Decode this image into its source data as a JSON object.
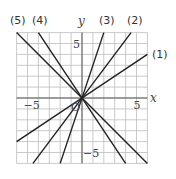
{
  "chart_data": {
    "type": "line",
    "title": "",
    "xlabel": "x",
    "ylabel": "y",
    "xlim": [
      -6,
      6
    ],
    "ylim": [
      -6,
      6
    ],
    "grid": true,
    "origin_label": "O",
    "ticks": {
      "x": [
        {
          "value": -5,
          "label": "−5"
        },
        {
          "value": 5,
          "label": "5"
        }
      ],
      "y": [
        {
          "value": 5,
          "label": "5"
        },
        {
          "value": -5,
          "label": "−5"
        }
      ]
    },
    "series": [
      {
        "name": "(1)",
        "slope": 0.6667,
        "points": [
          [
            -6,
            -4
          ],
          [
            6,
            4
          ]
        ]
      },
      {
        "name": "(2)",
        "slope": 1.3333,
        "points": [
          [
            -4.5,
            -6
          ],
          [
            4.5,
            6
          ]
        ]
      },
      {
        "name": "(3)",
        "slope": 3,
        "points": [
          [
            -2,
            -6
          ],
          [
            2,
            6
          ]
        ]
      },
      {
        "name": "(4)",
        "slope": -1.5,
        "points": [
          [
            -4,
            6
          ],
          [
            4,
            -6
          ]
        ]
      },
      {
        "name": "(5)",
        "slope": -1,
        "points": [
          [
            -6,
            6
          ],
          [
            6,
            -6
          ]
        ]
      }
    ]
  }
}
